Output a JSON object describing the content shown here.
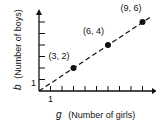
{
  "chart_data": {
    "type": "line",
    "title": "",
    "xlabel_var": "g",
    "xlabel": "(Number of girls)",
    "ylabel_var": "b",
    "ylabel": "(Number of boys)",
    "x_tick_label": "1",
    "y_tick_label": "1",
    "xlim": [
      0,
      10
    ],
    "ylim": [
      0,
      7
    ],
    "points": [
      {
        "x": 3,
        "y": 2,
        "label": "(3, 2)"
      },
      {
        "x": 6,
        "y": 4,
        "label": "(6, 4)"
      },
      {
        "x": 9,
        "y": 6,
        "label": "(9, 6)"
      }
    ],
    "line_style": "dashed",
    "line_from_origin": true
  }
}
